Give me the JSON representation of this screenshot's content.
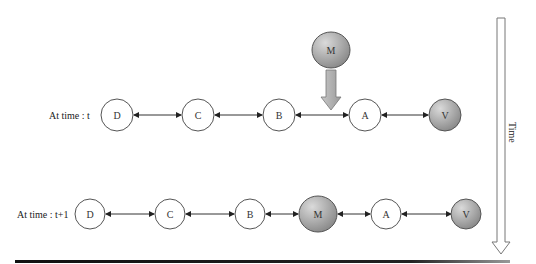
{
  "rows": [
    {
      "label": "At time : t",
      "nodes": [
        {
          "id": "D",
          "label": "D",
          "type": "white"
        },
        {
          "id": "C",
          "label": "C",
          "type": "white"
        },
        {
          "id": "B",
          "label": "B",
          "type": "white"
        },
        {
          "id": "A",
          "label": "A",
          "type": "white"
        },
        {
          "id": "V",
          "label": "V",
          "type": "gray"
        }
      ],
      "incoming_node": {
        "id": "M",
        "label": "M",
        "type": "gray",
        "inserts_between": [
          "B",
          "A"
        ]
      }
    },
    {
      "label": "At time : t+1",
      "nodes": [
        {
          "id": "D",
          "label": "D",
          "type": "white"
        },
        {
          "id": "C",
          "label": "C",
          "type": "white"
        },
        {
          "id": "B",
          "label": "B",
          "type": "white"
        },
        {
          "id": "M",
          "label": "M",
          "type": "gray"
        },
        {
          "id": "A",
          "label": "A",
          "type": "white"
        },
        {
          "id": "V",
          "label": "V",
          "type": "gray"
        }
      ]
    }
  ],
  "time_axis": {
    "label": "Time",
    "direction": "down"
  },
  "colors": {
    "node_white_fill": "#ffffff",
    "node_gray_light": "#d4d4d4",
    "node_gray_dark": "#8a8a8a",
    "stroke": "#555555",
    "edge": "#333333",
    "rule": "#111111"
  }
}
